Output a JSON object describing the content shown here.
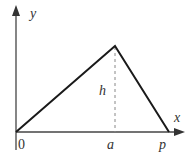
{
  "diagram": {
    "type": "triangle-function-graph",
    "axes": {
      "x_label": "x",
      "y_label": "y",
      "origin_label": "0"
    },
    "points": {
      "peak_x_label": "a",
      "end_x_label": "p",
      "height_label": "h"
    },
    "vertices": [
      {
        "name": "origin",
        "x": 0,
        "y": 0
      },
      {
        "name": "peak",
        "x": "a",
        "y": "h"
      },
      {
        "name": "end",
        "x": "p",
        "y": 0
      }
    ],
    "colors": {
      "line": "#1a1a1a",
      "axis": "#444444",
      "dashed": "#888888",
      "background": "#ffffff"
    }
  }
}
